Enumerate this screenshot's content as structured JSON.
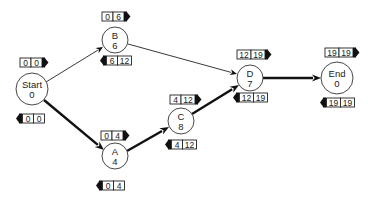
{
  "diagram": {
    "type": "activity-on-node network (critical path)",
    "nodes": [
      {
        "id": "start",
        "name": "Start",
        "duration": "0",
        "cx": 32,
        "cy": 89,
        "r": 16,
        "forward": {
          "a": "0",
          "b": "0",
          "x": 20,
          "y": 58
        },
        "backward": {
          "a": "0",
          "b": "0",
          "x": 20,
          "y": 114
        }
      },
      {
        "id": "b",
        "name": "B",
        "duration": "6",
        "cx": 115,
        "cy": 40,
        "r": 13,
        "forward": {
          "a": "0",
          "b": "6",
          "x": 102,
          "y": 12
        },
        "backward": {
          "a": "6",
          "b": "12",
          "x": 104,
          "y": 56
        }
      },
      {
        "id": "a",
        "name": "A",
        "duration": "4",
        "cx": 115,
        "cy": 156,
        "r": 13,
        "forward": {
          "a": "0",
          "b": "4",
          "x": 101,
          "y": 131
        },
        "backward": {
          "a": "0",
          "b": "4",
          "x": 100,
          "y": 181
        }
      },
      {
        "id": "c",
        "name": "C",
        "duration": "8",
        "cx": 181,
        "cy": 121,
        "r": 13,
        "forward": {
          "a": "4",
          "b": "12",
          "x": 170,
          "y": 95
        },
        "backward": {
          "a": "4",
          "b": "12",
          "x": 169,
          "y": 140
        }
      },
      {
        "id": "d",
        "name": "D",
        "duration": "7",
        "cx": 250,
        "cy": 78,
        "r": 13,
        "forward": {
          "a": "12",
          "b": "19",
          "x": 237,
          "y": 50
        },
        "backward": {
          "a": "12",
          "b": "19",
          "x": 237,
          "y": 93
        }
      },
      {
        "id": "end",
        "name": "End",
        "duration": "0",
        "cx": 337,
        "cy": 78,
        "r": 16,
        "forward": {
          "a": "19",
          "b": "19",
          "x": 325,
          "y": 48
        },
        "backward": {
          "a": "19",
          "b": "19",
          "x": 324,
          "y": 98
        }
      }
    ],
    "edges": [
      {
        "from": "start",
        "to": "b",
        "critical": false,
        "x1": 46,
        "y1": 82,
        "x2": 103,
        "y2": 47
      },
      {
        "from": "start",
        "to": "a",
        "critical": true,
        "x1": 44,
        "y1": 100,
        "x2": 104,
        "y2": 150
      },
      {
        "from": "b",
        "to": "d",
        "critical": false,
        "x1": 128,
        "y1": 44,
        "x2": 237,
        "y2": 74
      },
      {
        "from": "a",
        "to": "c",
        "critical": true,
        "x1": 127,
        "y1": 151,
        "x2": 169,
        "y2": 127
      },
      {
        "from": "c",
        "to": "d",
        "critical": true,
        "x1": 192,
        "y1": 114,
        "x2": 239,
        "y2": 85
      },
      {
        "from": "d",
        "to": "end",
        "critical": true,
        "x1": 263,
        "y1": 78,
        "x2": 321,
        "y2": 78
      }
    ],
    "legend_semantics": {
      "forward_box": "earliest start | earliest finish (right-pointing marker)",
      "backward_box": "latest start | latest finish (left-pointing marker)"
    }
  }
}
